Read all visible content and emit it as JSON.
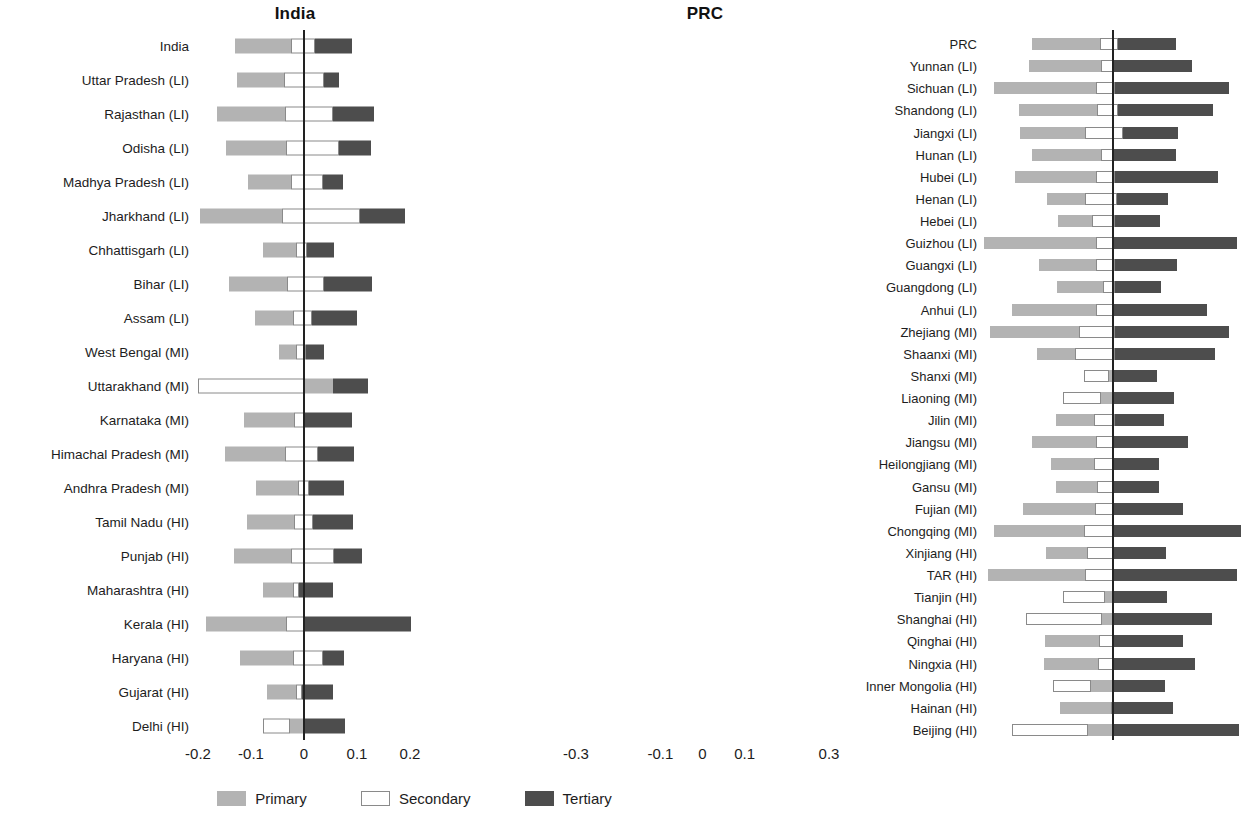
{
  "figure": {
    "type": "diverging-stacked-bar",
    "panels": [
      "India",
      "PRC"
    ]
  },
  "legend": {
    "position": "bottom-center",
    "items": [
      {
        "label": "Primary",
        "color": "#b3b3b3",
        "key": "primary"
      },
      {
        "label": "Secondary",
        "color": "#ffffff",
        "key": "secondary"
      },
      {
        "label": "Tertiary",
        "color": "#4d4d4d",
        "key": "tertiary"
      }
    ]
  },
  "chart_data": [
    {
      "type": "bar",
      "title": "India",
      "orientation": "horizontal",
      "stacked": true,
      "diverging": true,
      "xlabel": "",
      "ylabel": "",
      "xlim": [
        -0.2,
        0.2
      ],
      "xticks": [
        -0.2,
        -0.1,
        0,
        0.1,
        0.2
      ],
      "xticklabels": [
        "-0.2",
        "-0.1",
        "0",
        "0.1",
        "0.2"
      ],
      "grid": false,
      "zero_reference_line": true,
      "series": [
        "Primary",
        "Secondary",
        "Tertiary"
      ],
      "categories": [
        "India",
        "Uttar Pradesh (LI)",
        "Rajasthan (LI)",
        "Odisha (LI)",
        "Madhya Pradesh (LI)",
        "Jharkhand (LI)",
        "Chhattisgarh (LI)",
        "Bihar (LI)",
        "Assam (LI)",
        "West Bengal (MI)",
        "Uttarakhand (MI)",
        "Karnataka (MI)",
        "Himachal Pradesh (MI)",
        "Andhra Pradesh (MI)",
        "Tamil Nadu (HI)",
        "Punjab (HI)",
        "Maharashtra (HI)",
        "Kerala (HI)",
        "Haryana (HI)",
        "Gujarat (HI)",
        "Delhi (HI)"
      ],
      "bars": [
        {
          "category": "India",
          "start": -0.13,
          "primary": 0.105,
          "secondary": 0.045,
          "tertiary": 0.07
        },
        {
          "category": "Uttar Pradesh (LI)",
          "start": -0.127,
          "primary": 0.09,
          "secondary": 0.075,
          "tertiary": 0.028
        },
        {
          "category": "Rajasthan (LI)",
          "start": -0.165,
          "primary": 0.13,
          "secondary": 0.09,
          "tertiary": 0.078
        },
        {
          "category": "Odisha (LI)",
          "start": -0.148,
          "primary": 0.115,
          "secondary": 0.1,
          "tertiary": 0.06
        },
        {
          "category": "Madhya Pradesh (LI)",
          "start": -0.105,
          "primary": 0.08,
          "secondary": 0.06,
          "tertiary": 0.038
        },
        {
          "category": "Jharkhand (LI)",
          "start": -0.197,
          "primary": 0.155,
          "secondary": 0.148,
          "tertiary": 0.085
        },
        {
          "category": "Chhattisgarh (LI)",
          "start": -0.078,
          "primary": 0.063,
          "secondary": 0.02,
          "tertiary": 0.052
        },
        {
          "category": "Bihar (LI)",
          "start": -0.142,
          "primary": 0.11,
          "secondary": 0.07,
          "tertiary": 0.09
        },
        {
          "category": "Assam (LI)",
          "start": -0.092,
          "primary": 0.072,
          "secondary": 0.035,
          "tertiary": 0.085
        },
        {
          "category": "West Bengal (MI)",
          "start": -0.048,
          "primary": 0.033,
          "secondary": 0.018,
          "tertiary": 0.035
        },
        {
          "category": "Uttarakhand (MI)",
          "start": -0.2,
          "primary": 0.055,
          "secondary": 0.2,
          "tertiary": 0.065
        },
        {
          "category": "Karnataka (MI)",
          "start": -0.113,
          "primary": 0.095,
          "secondary": 0.018,
          "tertiary": 0.09
        },
        {
          "category": "Himachal Pradesh (MI)",
          "start": -0.15,
          "primary": 0.115,
          "secondary": 0.062,
          "tertiary": 0.068
        },
        {
          "category": "Andhra Pradesh (MI)",
          "start": -0.09,
          "primary": 0.078,
          "secondary": 0.022,
          "tertiary": 0.065
        },
        {
          "category": "Tamil Nadu (HI)",
          "start": -0.108,
          "primary": 0.09,
          "secondary": 0.035,
          "tertiary": 0.075
        },
        {
          "category": "Punjab (HI)",
          "start": -0.132,
          "primary": 0.108,
          "secondary": 0.08,
          "tertiary": 0.053
        },
        {
          "category": "Maharashtra (HI)",
          "start": -0.078,
          "primary": 0.058,
          "secondary": 0.01,
          "tertiary": 0.065
        },
        {
          "category": "Kerala (HI)",
          "start": -0.185,
          "primary": 0.152,
          "secondary": 0.035,
          "tertiary": 0.2
        },
        {
          "category": "Haryana (HI)",
          "start": -0.12,
          "primary": 0.1,
          "secondary": 0.055,
          "tertiary": 0.04
        },
        {
          "category": "Gujarat (HI)",
          "start": -0.07,
          "primary": 0.055,
          "secondary": 0.012,
          "tertiary": 0.058
        },
        {
          "category": "Delhi (HI)",
          "start": -0.078,
          "primary": 0.025,
          "secondary": 0.052,
          "tertiary": 0.078
        }
      ]
    },
    {
      "type": "bar",
      "title": "PRC",
      "orientation": "horizontal",
      "stacked": true,
      "diverging": true,
      "xlabel": "",
      "ylabel": "",
      "xlim": [
        -0.3,
        0.3
      ],
      "xticks": [
        -0.3,
        -0.1,
        0,
        0.1,
        0.3
      ],
      "xticklabels": [
        "-0.3",
        "-0.1",
        "0",
        "0.1",
        "0.3"
      ],
      "grid": false,
      "zero_reference_line": true,
      "series": [
        "Primary",
        "Secondary",
        "Tertiary"
      ],
      "categories": [
        "PRC",
        "Yunnan (LI)",
        "Sichuan (LI)",
        "Shandong (LI)",
        "Jiangxi (LI)",
        "Hunan (LI)",
        "Hubei (LI)",
        "Henan (LI)",
        "Hebei (LI)",
        "Guizhou (LI)",
        "Guangxi (LI)",
        "Guangdong (LI)",
        "Anhui (LI)",
        "Zhejiang (MI)",
        "Shaanxi (MI)",
        "Shanxi (MI)",
        "Liaoning (MI)",
        "Jilin (MI)",
        "Jiangsu (MI)",
        "Heilongjiang (MI)",
        "Gansu (MI)",
        "Fujian (MI)",
        "Chongqing (MI)",
        "Xinjiang (HI)",
        "TAR (HI)",
        "Tianjin (HI)",
        "Shanghai (HI)",
        "Qinghai (HI)",
        "Ningxia (HI)",
        "Inner Mongolia (HI)",
        "Hainan (HI)",
        "Beijing (HI)"
      ],
      "bars": [
        {
          "category": "PRC",
          "start": -0.19,
          "primary": 0.16,
          "secondary": 0.043,
          "tertiary": 0.138
        },
        {
          "category": "Yunnan (LI)",
          "start": -0.198,
          "primary": 0.17,
          "secondary": 0.032,
          "tertiary": 0.185
        },
        {
          "category": "Sichuan (LI)",
          "start": -0.28,
          "primary": 0.24,
          "secondary": 0.047,
          "tertiary": 0.27
        },
        {
          "category": "Shandong (LI)",
          "start": -0.222,
          "primary": 0.185,
          "secondary": 0.05,
          "tertiary": 0.225
        },
        {
          "category": "Jiangxi (LI)",
          "start": -0.22,
          "primary": 0.155,
          "secondary": 0.09,
          "tertiary": 0.13
        },
        {
          "category": "Hunan (LI)",
          "start": -0.19,
          "primary": 0.162,
          "secondary": 0.03,
          "tertiary": 0.148
        },
        {
          "category": "Hubei (LI)",
          "start": -0.232,
          "primary": 0.192,
          "secondary": 0.045,
          "tertiary": 0.245
        },
        {
          "category": "Henan (LI)",
          "start": -0.155,
          "primary": 0.09,
          "secondary": 0.075,
          "tertiary": 0.122
        },
        {
          "category": "Hebei (LI)",
          "start": -0.13,
          "primary": 0.082,
          "secondary": 0.053,
          "tertiary": 0.108
        },
        {
          "category": "Guizhou (LI)",
          "start": -0.305,
          "primary": 0.265,
          "secondary": 0.043,
          "tertiary": 0.292
        },
        {
          "category": "Guangxi (LI)",
          "start": -0.175,
          "primary": 0.135,
          "secondary": 0.045,
          "tertiary": 0.148
        },
        {
          "category": "Guangdong (LI)",
          "start": -0.132,
          "primary": 0.11,
          "secondary": 0.028,
          "tertiary": 0.108
        },
        {
          "category": "Anhui (LI)",
          "start": -0.238,
          "primary": 0.2,
          "secondary": 0.042,
          "tertiary": 0.22
        },
        {
          "category": "Zhejiang (MI)",
          "start": -0.29,
          "primary": 0.21,
          "secondary": 0.085,
          "tertiary": 0.272
        },
        {
          "category": "Shaanxi (MI)",
          "start": -0.18,
          "primary": 0.09,
          "secondary": 0.095,
          "tertiary": 0.238
        },
        {
          "category": "Shanxi (MI)",
          "start": -0.068,
          "primary": 0.008,
          "secondary": 0.06,
          "tertiary": 0.105
        },
        {
          "category": "Liaoning (MI)",
          "start": -0.118,
          "primary": 0.03,
          "secondary": 0.09,
          "tertiary": 0.145
        },
        {
          "category": "Jilin (MI)",
          "start": -0.135,
          "primary": 0.092,
          "secondary": 0.048,
          "tertiary": 0.118
        },
        {
          "category": "Jiangsu (MI)",
          "start": -0.19,
          "primary": 0.152,
          "secondary": 0.042,
          "tertiary": 0.175
        },
        {
          "category": "Heilongjiang (MI)",
          "start": -0.145,
          "primary": 0.1,
          "secondary": 0.048,
          "tertiary": 0.108
        },
        {
          "category": "Gansu (MI)",
          "start": -0.135,
          "primary": 0.098,
          "secondary": 0.04,
          "tertiary": 0.108
        },
        {
          "category": "Fujian (MI)",
          "start": -0.212,
          "primary": 0.17,
          "secondary": 0.045,
          "tertiary": 0.165
        },
        {
          "category": "Chongqing (MI)",
          "start": -0.28,
          "primary": 0.212,
          "secondary": 0.072,
          "tertiary": 0.3
        },
        {
          "category": "Xinjiang (HI)",
          "start": -0.158,
          "primary": 0.098,
          "secondary": 0.062,
          "tertiary": 0.125
        },
        {
          "category": "TAR (HI)",
          "start": -0.295,
          "primary": 0.23,
          "secondary": 0.068,
          "tertiary": 0.292
        },
        {
          "category": "Tianjin (HI)",
          "start": -0.118,
          "primary": 0.022,
          "secondary": 0.1,
          "tertiary": 0.125
        },
        {
          "category": "Shanghai (HI)",
          "start": -0.205,
          "primary": 0.028,
          "secondary": 0.18,
          "tertiary": 0.232
        },
        {
          "category": "Qinghai (HI)",
          "start": -0.16,
          "primary": 0.128,
          "secondary": 0.035,
          "tertiary": 0.165
        },
        {
          "category": "Ningxia (HI)",
          "start": -0.162,
          "primary": 0.128,
          "secondary": 0.038,
          "tertiary": 0.192
        },
        {
          "category": "Inner Mongolia (HI)",
          "start": -0.14,
          "primary": 0.052,
          "secondary": 0.09,
          "tertiary": 0.122
        },
        {
          "category": "Hainan (HI)",
          "start": -0.125,
          "primary": 0.122,
          "secondary": 0.006,
          "tertiary": 0.14
        },
        {
          "category": "Beijing (HI)",
          "start": -0.238,
          "primary": 0.06,
          "secondary": 0.18,
          "tertiary": 0.298
        }
      ]
    }
  ]
}
